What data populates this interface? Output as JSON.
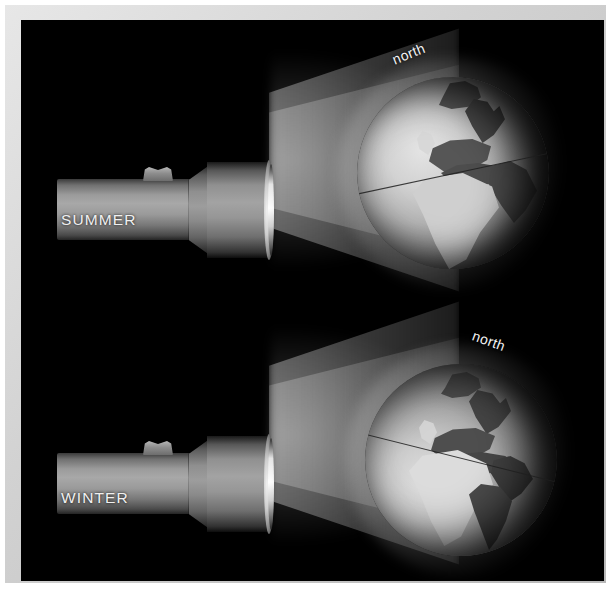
{
  "figure": {
    "background_color": "#000000",
    "frame_color": "#d2d2d2",
    "label_color": "#f0f0f0"
  },
  "panels": [
    {
      "id": "summer",
      "season_label": "SUMMER",
      "north_label": "north",
      "north_rotation_deg": -22,
      "tilt_description": "northern hemisphere tilted toward the light",
      "equator_angle_deg": -12,
      "globe_visible_continents": [
        "Europe",
        "Africa",
        "Greenland",
        "Arabia",
        "India"
      ]
    },
    {
      "id": "winter",
      "season_label": "WINTER",
      "north_label": "north",
      "north_rotation_deg": 20,
      "tilt_description": "northern hemisphere tilted away from the light",
      "equator_angle_deg": 14,
      "globe_visible_continents": [
        "Europe",
        "Africa",
        "South America",
        "Greenland",
        "North America"
      ]
    }
  ],
  "objects": {
    "flashlight_name": "flashlight",
    "beam_name": "light-beam",
    "globe_name": "globe"
  }
}
